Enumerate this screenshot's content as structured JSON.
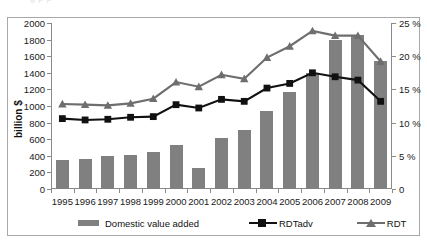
{
  "ghost_text": "       g          p                                                  p   ",
  "axes": {
    "left_title": "billion $",
    "left_ticks": [
      "2000",
      "1800",
      "1600",
      "1400",
      "1200",
      "1000",
      "800",
      "600",
      "400",
      "200",
      "0"
    ],
    "right_ticks": [
      "25 %",
      "20 %",
      "15 %",
      "10 %",
      "5  %",
      "0"
    ]
  },
  "legend": {
    "items": [
      {
        "label": "Domestic value added",
        "marker": "bar-swatch",
        "color": "#808080"
      },
      {
        "label": "RDTadv",
        "marker": "square-marker",
        "color": "#111111"
      },
      {
        "label": "RDT",
        "marker": "triangle-marker",
        "color": "#6e6e6e"
      }
    ]
  },
  "chart_data": {
    "type": "bar",
    "title": "",
    "xlabel": "",
    "ylabel": "billion $",
    "y2label": "%",
    "ylim": [
      0,
      2000
    ],
    "y2lim": [
      0,
      25
    ],
    "grid": false,
    "legend_position": "bottom",
    "categories": [
      "1995",
      "1996",
      "1997",
      "1998",
      "1999",
      "2000",
      "2001",
      "2002",
      "2003",
      "2004",
      "2005",
      "2006",
      "2007",
      "2008",
      "2009"
    ],
    "series": [
      {
        "name": "Domestic value added",
        "type": "bar",
        "axis": "left",
        "unit": "billion $",
        "color": "#808080",
        "values": [
          350,
          365,
          395,
          410,
          440,
          530,
          250,
          615,
          705,
          945,
          1165,
          1400,
          1790,
          1850,
          1540
        ]
      },
      {
        "name": "RDTadv",
        "type": "line",
        "axis": "right",
        "unit": "%",
        "color": "#111111",
        "marker": "square",
        "values": [
          10.6,
          10.4,
          10.5,
          10.8,
          10.9,
          12.7,
          12.2,
          13.5,
          13.2,
          15.2,
          15.9,
          17.5,
          16.9,
          16.4,
          13.2
        ]
      },
      {
        "name": "RDT",
        "type": "line",
        "axis": "right",
        "unit": "%",
        "color": "#6e6e6e",
        "marker": "triangle",
        "values": [
          12.8,
          12.7,
          12.6,
          12.9,
          13.6,
          16.1,
          15.4,
          17.2,
          16.6,
          19.8,
          21.5,
          23.8,
          23.1,
          23.1,
          19.2
        ]
      }
    ]
  }
}
